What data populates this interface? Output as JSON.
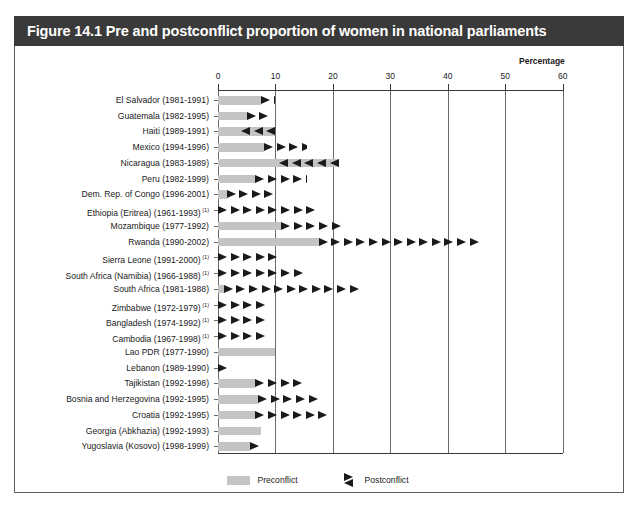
{
  "figure": {
    "title": "Figure 14.1 Pre and postconflict proportion of women in national parliaments",
    "percentage_caption": "Percentage"
  },
  "legend": {
    "preconflict_label": "Preconflict",
    "postconflict_label": "Postconflict",
    "preconflict_color": "#c4c4c4",
    "postconflict_color": "#1a1a1a"
  },
  "chart_data": {
    "type": "bar",
    "title": "Figure 14.1 Pre and postconflict proportion of women in national parliaments",
    "xlabel": "Percentage",
    "ylabel": "",
    "xlim": [
      0,
      60
    ],
    "xticks": [
      0,
      10,
      20,
      30,
      40,
      50,
      60
    ],
    "grid": true,
    "legend_position": "bottom-center",
    "orientation": "horizontal",
    "series": [
      {
        "name": "Preconflict",
        "values": [
          7.5,
          5.0,
          10.0,
          8.0,
          21.0,
          6.5,
          1.5,
          0.0,
          11.0,
          17.5,
          0.0,
          0.0,
          1.0,
          0.0,
          0.0,
          0.0,
          10.0,
          0.0,
          6.5,
          7.0,
          6.5,
          7.5,
          5.5
        ]
      },
      {
        "name": "Postconflict",
        "values": [
          10.0,
          9.5,
          4.0,
          15.5,
          10.5,
          15.5,
          10.0,
          22.0,
          25.0,
          50.0,
          13.0,
          18.0,
          30.0,
          10.0,
          10.0,
          10.0,
          10.0,
          1.5,
          16.0,
          19.0,
          25.5,
          7.0,
          7.5
        ]
      }
    ],
    "categories": [
      "El Salvador (1981-1991)",
      "Guatemala (1982-1995)",
      "Haiti (1989-1991)",
      "Mexico (1994-1996)",
      "Nicaragua (1983-1989)",
      "Peru (1982-1999)",
      "Dem. Rep. of Congo (1996-2001)",
      "Ethiopia (Eritrea) (1961-1993)",
      "Mozambique (1977-1992)",
      "Rwanda (1990-2002)",
      "Sierra Leone (1991-2000)",
      "South Africa (Namibia) (1966-1988)",
      "South Africa (1981-1988)",
      "Zimbabwe (1972-1979)",
      "Bangladesh (1974-1992)",
      "Cambodia (1967-1998)",
      "Lao PDR (1977-1990)",
      "Lebanon (1989-1990)",
      "Tajikistan (1992-1998)",
      "Bosnia and Herzegovina (1992-1995)",
      "Croatia (1992-1995)",
      "Georgia (Abkhazia) (1992-1993)",
      "Yugoslavia (Kosovo) (1998-1999)"
    ],
    "rows": [
      {
        "label": "El Salvador (1981-1991)",
        "note": "",
        "pre": 7.5,
        "post": 10.0,
        "direction": "right",
        "arrows": 2
      },
      {
        "label": "Guatemala (1982-1995)",
        "note": "",
        "pre": 5.0,
        "post": 9.5,
        "direction": "right",
        "arrows": 2
      },
      {
        "label": "Haiti (1989-1991)",
        "note": "",
        "pre": 10.0,
        "post": 4.0,
        "direction": "left",
        "arrows": 3
      },
      {
        "label": "Mexico (1994-1996)",
        "note": "",
        "pre": 8.0,
        "post": 15.5,
        "direction": "right",
        "arrows": 4
      },
      {
        "label": "Nicaragua (1983-1989)",
        "note": "",
        "pre": 21.0,
        "post": 10.5,
        "direction": "left",
        "arrows": 5
      },
      {
        "label": "Peru (1982-1999)",
        "note": "",
        "pre": 6.5,
        "post": 15.5,
        "direction": "right",
        "arrows": 5
      },
      {
        "label": "Dem. Rep. of Congo (1996-2001)",
        "note": "",
        "pre": 1.5,
        "post": 10.0,
        "direction": "right",
        "arrows": 4
      },
      {
        "label": "Ethiopia (Eritrea) (1961-1993)",
        "note": "(1)",
        "pre": 0.0,
        "post": 22.0,
        "direction": "right",
        "arrows": 8
      },
      {
        "label": "Mozambique (1977-1992)",
        "note": "",
        "pre": 11.0,
        "post": 25.0,
        "direction": "right",
        "arrows": 5
      },
      {
        "label": "Rwanda (1990-2002)",
        "note": "",
        "pre": 17.5,
        "post": 50.0,
        "direction": "right",
        "arrows": 13
      },
      {
        "label": "Sierra Leone (1991-2000)",
        "note": "(1)",
        "pre": 0.0,
        "post": 13.0,
        "direction": "right",
        "arrows": 5
      },
      {
        "label": "South Africa (Namibia) (1966-1988)",
        "note": "(1)",
        "pre": 0.0,
        "post": 18.0,
        "direction": "right",
        "arrows": 7
      },
      {
        "label": "South Africa (1981-1988)",
        "note": "",
        "pre": 1.0,
        "post": 30.0,
        "direction": "right",
        "arrows": 11
      },
      {
        "label": "Zimbabwe (1972-1979)",
        "note": "(1)",
        "pre": 0.0,
        "post": 10.0,
        "direction": "right",
        "arrows": 4
      },
      {
        "label": "Bangladesh (1974-1992)",
        "note": "(1)",
        "pre": 0.0,
        "post": 10.0,
        "direction": "right",
        "arrows": 4
      },
      {
        "label": "Cambodia (1967-1998)",
        "note": "(1)",
        "pre": 0.0,
        "post": 10.0,
        "direction": "right",
        "arrows": 4
      },
      {
        "label": "Lao PDR (1977-1990)",
        "note": "",
        "pre": 10.0,
        "post": 10.0,
        "direction": "none",
        "arrows": 0
      },
      {
        "label": "Lebanon (1989-1990)",
        "note": "",
        "pre": 0.0,
        "post": 1.5,
        "direction": "right",
        "arrows": 1
      },
      {
        "label": "Tajikistan (1992-1998)",
        "note": "",
        "pre": 6.5,
        "post": 16.0,
        "direction": "right",
        "arrows": 4
      },
      {
        "label": "Bosnia and Herzegovina (1992-1995)",
        "note": "",
        "pre": 7.0,
        "post": 19.0,
        "direction": "right",
        "arrows": 5
      },
      {
        "label": "Croatia (1992-1995)",
        "note": "",
        "pre": 6.5,
        "post": 25.5,
        "direction": "right",
        "arrows": 6
      },
      {
        "label": "Georgia (Abkhazia) (1992-1993)",
        "note": "",
        "pre": 7.5,
        "post": 7.0,
        "direction": "none",
        "arrows": 0
      },
      {
        "label": "Yugoslavia (Kosovo) (1998-1999)",
        "note": "",
        "pre": 5.5,
        "post": 7.5,
        "direction": "right",
        "arrows": 1
      }
    ]
  }
}
